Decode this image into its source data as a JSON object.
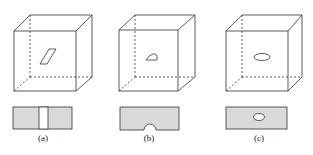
{
  "figure": {
    "panels": [
      {
        "id": "a",
        "label": "(a)",
        "inclusion_shape": "parallelogram",
        "section_feature": "vertical-through-slot"
      },
      {
        "id": "b",
        "label": "(b)",
        "inclusion_shape": "half-disc",
        "section_feature": "surface-notch"
      },
      {
        "id": "c",
        "label": "(c)",
        "inclusion_shape": "ellipse",
        "section_feature": "internal-elliptical-void"
      }
    ],
    "colors": {
      "line": "#333333",
      "section_fill": "#d9d9d9",
      "background": "#ffffff"
    }
  }
}
